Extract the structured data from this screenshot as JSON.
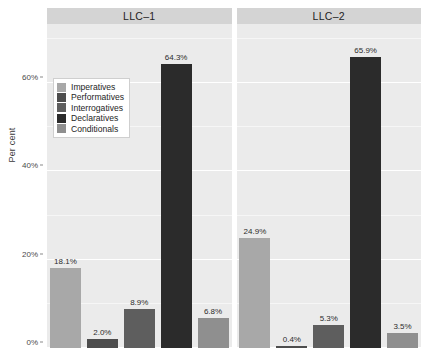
{
  "chart": {
    "type": "bar",
    "title": "",
    "ylabel": "Per cent",
    "xlabel": ""
  },
  "axis": {
    "y_title": "Per cent",
    "y_ticks": [
      {
        "label": "0%",
        "value": 0
      },
      {
        "label": "20%",
        "value": 20
      },
      {
        "label": "40%",
        "value": 40
      },
      {
        "label": "60%",
        "value": 60
      }
    ]
  },
  "legend": {
    "items": [
      {
        "label": "Imperatives",
        "color": "#a8a8a8"
      },
      {
        "label": "Performatives",
        "color": "#4d4d4d"
      },
      {
        "label": "Interrogatives",
        "color": "#5e5e5e"
      },
      {
        "label": "Declaratives",
        "color": "#2b2b2b"
      },
      {
        "label": "Conditionals",
        "color": "#8f8f8f"
      }
    ]
  },
  "panels": [
    {
      "title": "LLC–1",
      "bars": [
        {
          "category": "Imperatives",
          "value": 18.1,
          "label": "18.1%",
          "color": "#a8a8a8"
        },
        {
          "category": "Performatives",
          "value": 2.0,
          "label": "2.0%",
          "color": "#4d4d4d"
        },
        {
          "category": "Interrogatives",
          "value": 8.9,
          "label": "8.9%",
          "color": "#5e5e5e"
        },
        {
          "category": "Declaratives",
          "value": 64.3,
          "label": "64.3%",
          "color": "#2b2b2b"
        },
        {
          "category": "Conditionals",
          "value": 6.8,
          "label": "6.8%",
          "color": "#8f8f8f"
        }
      ]
    },
    {
      "title": "LLC–2",
      "bars": [
        {
          "category": "Imperatives",
          "value": 24.9,
          "label": "24.9%",
          "color": "#a8a8a8"
        },
        {
          "category": "Performatives",
          "value": 0.4,
          "label": "0.4%",
          "color": "#4d4d4d"
        },
        {
          "category": "Interrogatives",
          "value": 5.3,
          "label": "5.3%",
          "color": "#5e5e5e"
        },
        {
          "category": "Declaratives",
          "value": 65.9,
          "label": "65.9%",
          "color": "#2b2b2b"
        },
        {
          "category": "Conditionals",
          "value": 3.5,
          "label": "3.5%",
          "color": "#8f8f8f"
        }
      ]
    }
  ],
  "chart_data": {
    "type": "bar",
    "title": "",
    "xlabel": "",
    "ylabel": "Per cent",
    "ylim": [
      0,
      72
    ],
    "grid": true,
    "legend_position": "inside-top-left",
    "facets": [
      "LLC–1",
      "LLC–2"
    ],
    "categories": [
      "Imperatives",
      "Performatives",
      "Interrogatives",
      "Declaratives",
      "Conditionals"
    ],
    "series": [
      {
        "name": "LLC–1",
        "values": [
          18.1,
          2.0,
          8.9,
          64.3,
          6.8
        ]
      },
      {
        "name": "LLC–2",
        "values": [
          24.9,
          0.4,
          5.3,
          65.9,
          3.5
        ]
      }
    ],
    "data_labels": [
      [
        "18.1%",
        "2.0%",
        "8.9%",
        "64.3%",
        "6.8%"
      ],
      [
        "24.9%",
        "0.4%",
        "5.3%",
        "65.9%",
        "3.5%"
      ]
    ],
    "ytick_labels": [
      "0%",
      "20%",
      "40%",
      "60%"
    ],
    "ytick_values": [
      0,
      20,
      40,
      60
    ]
  }
}
